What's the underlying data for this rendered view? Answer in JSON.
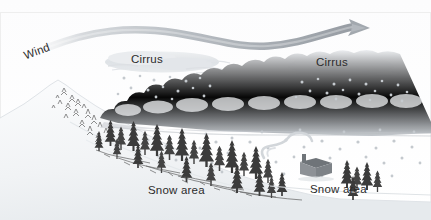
{
  "figure": {
    "type": "meteorological-cross-section",
    "background_color": "#ffffff",
    "frame_color": "#e9e9e9"
  },
  "labels": {
    "wind": "Wind",
    "cirrus_left": "Cirrus",
    "cirrus_right": "Cirrus",
    "snow_area_left": "Snow area",
    "snow_area_right": "Snow area"
  },
  "colors": {
    "wind_ribbon": "#b9bcc0",
    "wind_ribbon_dark": "#9aa0a6",
    "cirrus": "#dfe2e6",
    "stratus": "#d5d9dd",
    "stratus_shadow": "#c3c8cd",
    "mountain_snow": "#f2f4f6",
    "mountain_shade": "#e3e7ea",
    "tree_dark": "#3b3b3b",
    "snowflake": "#c9ced3",
    "cabin": "#8d9196",
    "cabin_roof": "#6f7479",
    "smoke": "#d9dcdf",
    "text": "#2b2b2b",
    "ground_line": "#d0d4d8"
  },
  "elements": {
    "wind_arrow": {
      "name": "wind-arrow-ribbon",
      "shape": "wavy-s-curve-with-arrowhead",
      "direction": "left-to-right",
      "start_x": 46,
      "end_x": 368,
      "y_center": 36
    },
    "cirrus_clouds": [
      {
        "name": "cirrus-cloud-left",
        "cx": 160,
        "cy": 62,
        "rx": 58,
        "ry": 11
      },
      {
        "name": "cirrus-cloud-right",
        "cx": 340,
        "cy": 65,
        "rx": 52,
        "ry": 10
      }
    ],
    "stratus_band": {
      "name": "stratus-cloud-band",
      "x_start": 100,
      "x_end": 431,
      "y": 110
    },
    "mountain": {
      "name": "mountain-slope",
      "peak_x": 58,
      "peak_y": 82,
      "base_y": 200
    },
    "cabin": {
      "name": "cabin",
      "x": 303,
      "y": 166
    },
    "smoke": {
      "name": "chimney-smoke",
      "x": 272,
      "y": 152
    },
    "snowflake_count": 96,
    "tree_count": 34
  }
}
